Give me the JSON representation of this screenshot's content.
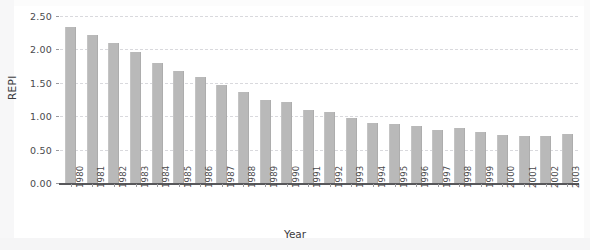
{
  "chart_data": {
    "type": "bar",
    "title": "",
    "xlabel": "Year",
    "ylabel": "REPI",
    "categories": [
      "1980",
      "1981",
      "1982",
      "1983",
      "1984",
      "1985",
      "1986",
      "1987",
      "1988",
      "1989",
      "1990",
      "1991",
      "1992",
      "1993",
      "1994",
      "1995",
      "1996",
      "1997",
      "1998",
      "1999",
      "2000",
      "2001",
      "2002",
      "2003"
    ],
    "values": [
      2.34,
      2.22,
      2.09,
      1.96,
      1.8,
      1.68,
      1.58,
      1.47,
      1.36,
      1.25,
      1.21,
      1.1,
      1.06,
      0.98,
      0.9,
      0.88,
      0.86,
      0.8,
      0.83,
      0.76,
      0.72,
      0.7,
      0.7,
      0.73
    ],
    "ylim": [
      0.0,
      2.5
    ],
    "ytick_labels": [
      "0.00",
      "0.50",
      "1.00",
      "1.50",
      "2.00",
      "2.50"
    ],
    "ytick_values": [
      0.0,
      0.5,
      1.0,
      1.5,
      2.0,
      2.5
    ],
    "grid": true,
    "legend": null,
    "bar_color": "#b9b9b9",
    "grid_color": "#d9d9dd",
    "axis_color": "#58585b"
  }
}
